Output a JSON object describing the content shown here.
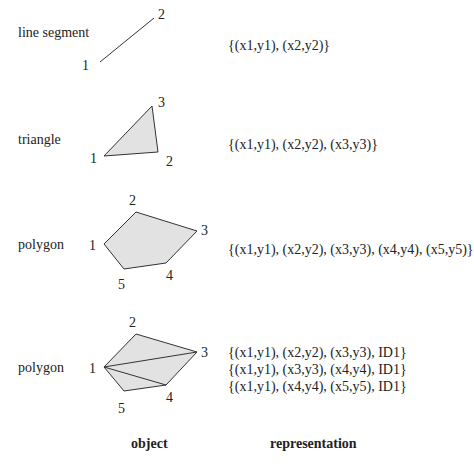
{
  "rows": [
    {
      "name": "line segment",
      "representation": [
        "{(x1,y1), (x2,y2)}"
      ],
      "vertex_labels": [
        "1",
        "2"
      ]
    },
    {
      "name": "triangle",
      "representation": [
        "{(x1,y1), (x2,y2), (x3,y3)}"
      ],
      "vertex_labels": [
        "1",
        "2",
        "3"
      ]
    },
    {
      "name": "polygon",
      "representation": [
        "{(x1,y1), (x2,y2), (x3,y3), (x4,y4), (x5,y5)}"
      ],
      "vertex_labels": [
        "1",
        "2",
        "3",
        "4",
        "5"
      ]
    },
    {
      "name": "polygon",
      "representation": [
        "{(x1,y1), (x2,y2), (x3,y3), ID1}",
        "{(x1,y1), (x3,y3), (x4,y4), ID1}",
        "{(x1,y1), (x4,y4), (x5,y5), ID1}"
      ],
      "vertex_labels": [
        "1",
        "2",
        "3",
        "4",
        "5"
      ]
    }
  ],
  "headers": {
    "object": "object",
    "representation": "representation"
  },
  "colors": {
    "fill": "#e2e2e2",
    "stroke": "#333333"
  }
}
